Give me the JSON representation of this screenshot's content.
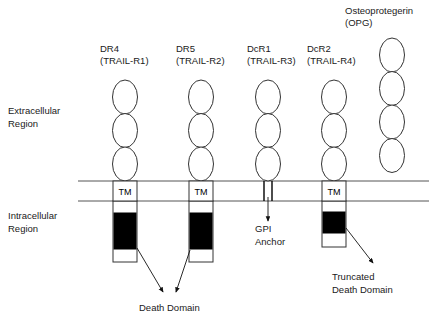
{
  "figure": {
    "kind": "trail-receptor-family-diagram",
    "regions": [
      {
        "id": "extracellular",
        "label": "Extracellular\nRegion",
        "line1": "Extracellular",
        "line2": "Region",
        "x": 8,
        "y": 114
      },
      {
        "id": "intracellular",
        "label": "Intracellular\nRegion",
        "line1": "Intracellular",
        "line2": "Region",
        "x": 8,
        "y": 219
      }
    ],
    "membrane": {
      "top_y": 181,
      "bottom_y": 201,
      "x_start": 78,
      "x_end": 429,
      "color": "#555555"
    },
    "receptors": [
      {
        "id": "dr4",
        "name": "DR4",
        "alt_name": "(TRAIL-R1)",
        "label_x": 100,
        "label_y": 52,
        "center_x": 125,
        "ellipses": {
          "count": 3,
          "top": 80,
          "rx": 12.5,
          "ry": 17,
          "spacing": 33.5
        },
        "tm": {
          "label": "TM",
          "x": 113,
          "y": 181,
          "w": 24,
          "h": 20
        },
        "stem": {
          "x": 113,
          "y": 201,
          "w": 24,
          "h": 61
        },
        "death_domain": {
          "x": 114,
          "y": 213,
          "w": 22,
          "h": 36,
          "color": "#000000"
        }
      },
      {
        "id": "dr5",
        "name": "DR5",
        "alt_name": "(TRAIL-R2)",
        "label_x": 176,
        "label_y": 52,
        "center_x": 201,
        "ellipses": {
          "count": 3,
          "top": 80,
          "rx": 12.5,
          "ry": 17,
          "spacing": 33.5
        },
        "tm": {
          "label": "TM",
          "x": 189,
          "y": 181,
          "w": 24,
          "h": 20
        },
        "stem": {
          "x": 189,
          "y": 201,
          "w": 24,
          "h": 61
        },
        "death_domain": {
          "x": 190,
          "y": 213,
          "w": 22,
          "h": 36,
          "color": "#000000"
        }
      },
      {
        "id": "dcr1",
        "name": "DcR1",
        "alt_name": "(TRAIL-R3)",
        "label_x": 247,
        "label_y": 52,
        "center_x": 268,
        "ellipses": {
          "count": 3,
          "top": 80,
          "rx": 12.5,
          "ry": 17,
          "spacing": 33.5
        },
        "gpi": {
          "line1_x": 264,
          "line2_x": 272,
          "y_top": 181,
          "y_bottom": 201
        },
        "tm": null,
        "stem": null,
        "death_domain": null
      },
      {
        "id": "dcr2",
        "name": "DcR2",
        "alt_name": "(TRAIL-R4)",
        "label_x": 307,
        "label_y": 52,
        "center_x": 334,
        "ellipses": {
          "count": 3,
          "top": 80,
          "rx": 12.5,
          "ry": 17,
          "spacing": 33.5
        },
        "tm": {
          "label": "TM",
          "x": 322,
          "y": 181,
          "w": 24,
          "h": 20
        },
        "stem": {
          "x": 322,
          "y": 201,
          "w": 24,
          "h": 46
        },
        "death_domain": {
          "x": 323,
          "y": 212,
          "w": 22,
          "h": 21,
          "color": "#000000"
        }
      },
      {
        "id": "opg",
        "name": "Osteoprotegerin",
        "alt_name": "(OPG)",
        "label_x": 345,
        "label_y": 14,
        "center_x": 392,
        "ellipses": {
          "count": 4,
          "top": 38,
          "rx": 12.5,
          "ry": 17,
          "spacing": 33.5
        },
        "tm": null,
        "stem": null,
        "death_domain": null
      }
    ],
    "annotations": [
      {
        "id": "death-domain",
        "line1": "Death Domain",
        "line2": "",
        "text_x": 139,
        "text_y": 311,
        "arrows": [
          {
            "x1": 137,
            "y1": 248,
            "x2": 163,
            "y2": 292
          },
          {
            "x1": 190,
            "y1": 250,
            "x2": 176,
            "y2": 292
          }
        ]
      },
      {
        "id": "gpi-anchor",
        "line1": "GPI",
        "line2": "Anchor",
        "text_x": 255,
        "text_y": 232,
        "arrows": [
          {
            "x1": 268,
            "y1": 197,
            "x2": 268,
            "y2": 221
          }
        ]
      },
      {
        "id": "truncated-death-domain",
        "line1": "Truncated",
        "line2": "Death Domain",
        "text_x": 332,
        "text_y": 280,
        "arrows": [
          {
            "x1": 346,
            "y1": 228,
            "x2": 373,
            "y2": 263
          }
        ]
      }
    ]
  }
}
